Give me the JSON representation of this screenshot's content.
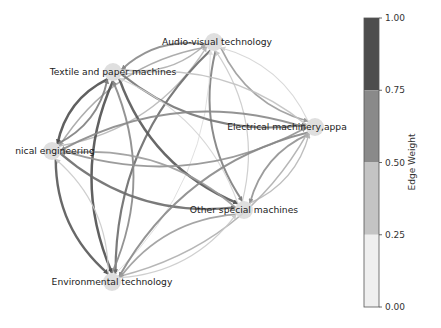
{
  "diagram": {
    "type": "directed-network",
    "nodes": [
      {
        "id": "av",
        "label": "Audio-visual technology",
        "x": 214,
        "y": 42,
        "label_x": 217,
        "label_y": 45
      },
      {
        "id": "tp",
        "label": "Textile and paper machines",
        "x": 113,
        "y": 72,
        "label_x": 113,
        "label_y": 75
      },
      {
        "id": "el",
        "label": "Electrical machinery,appa",
        "x": 315,
        "y": 127,
        "label_x": 287,
        "label_y": 130
      },
      {
        "id": "me",
        "label": "nical engineering",
        "x": 52,
        "y": 151,
        "label_x": 55,
        "label_y": 154
      },
      {
        "id": "os",
        "label": "Other special machines",
        "x": 244,
        "y": 210,
        "label_x": 244,
        "label_y": 213
      },
      {
        "id": "en",
        "label": "Environmental technology",
        "x": 112,
        "y": 282,
        "label_x": 112,
        "label_y": 285
      }
    ],
    "edges": [
      {
        "from": "av",
        "to": "tp",
        "weight": 0.55
      },
      {
        "from": "tp",
        "to": "av",
        "weight": 0.35
      },
      {
        "from": "av",
        "to": "me",
        "weight": 0.4
      },
      {
        "from": "me",
        "to": "av",
        "weight": 0.3
      },
      {
        "from": "av",
        "to": "el",
        "weight": 0.45
      },
      {
        "from": "el",
        "to": "av",
        "weight": 0.15
      },
      {
        "from": "av",
        "to": "os",
        "weight": 0.6
      },
      {
        "from": "os",
        "to": "av",
        "weight": 0.2
      },
      {
        "from": "av",
        "to": "en",
        "weight": 0.7
      },
      {
        "from": "en",
        "to": "av",
        "weight": 0.1
      },
      {
        "from": "tp",
        "to": "me",
        "weight": 0.85
      },
      {
        "from": "me",
        "to": "tp",
        "weight": 0.6
      },
      {
        "from": "tp",
        "to": "el",
        "weight": 0.65
      },
      {
        "from": "el",
        "to": "tp",
        "weight": 0.25
      },
      {
        "from": "tp",
        "to": "os",
        "weight": 0.8
      },
      {
        "from": "os",
        "to": "tp",
        "weight": 0.15
      },
      {
        "from": "tp",
        "to": "en",
        "weight": 0.85
      },
      {
        "from": "en",
        "to": "tp",
        "weight": 0.55
      },
      {
        "from": "me",
        "to": "el",
        "weight": 0.5
      },
      {
        "from": "el",
        "to": "me",
        "weight": 0.55
      },
      {
        "from": "me",
        "to": "os",
        "weight": 0.7
      },
      {
        "from": "os",
        "to": "me",
        "weight": 0.45
      },
      {
        "from": "me",
        "to": "en",
        "weight": 0.8
      },
      {
        "from": "en",
        "to": "me",
        "weight": 0.2
      },
      {
        "from": "el",
        "to": "os",
        "weight": 0.5
      },
      {
        "from": "os",
        "to": "el",
        "weight": 0.3
      },
      {
        "from": "el",
        "to": "en",
        "weight": 0.55
      },
      {
        "from": "en",
        "to": "el",
        "weight": 0.35
      },
      {
        "from": "os",
        "to": "en",
        "weight": 0.45
      },
      {
        "from": "en",
        "to": "os",
        "weight": 0.2
      }
    ],
    "colorbar": {
      "label": "Edge Weight",
      "ticks": [
        "1.00",
        "0.75",
        "0.50",
        "0.25",
        "0.00"
      ],
      "bins": [
        {
          "from": 0.75,
          "to": 1.0,
          "color": "#4d4d4d"
        },
        {
          "from": 0.5,
          "to": 0.75,
          "color": "#8a8a8a"
        },
        {
          "from": 0.25,
          "to": 0.5,
          "color": "#c4c4c4"
        },
        {
          "from": 0.0,
          "to": 0.25,
          "color": "#efefef"
        }
      ]
    },
    "node_color": "#d9d9d9"
  }
}
